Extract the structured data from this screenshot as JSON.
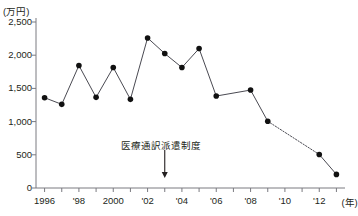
{
  "chart_data": {
    "type": "line",
    "title": "",
    "subtitle": "",
    "ylabel": "(万円)",
    "xlabel": "(年)",
    "ylim": [
      0,
      2500
    ],
    "ytick_values": [
      0,
      500,
      1000,
      1500,
      2000,
      2500
    ],
    "ytick_labels": [
      "0",
      "500",
      "1,000",
      "1,500",
      "2,000",
      "2,500"
    ],
    "xlim": [
      1995.5,
      2013.5
    ],
    "xtick_values": [
      1996,
      1997,
      1998,
      1999,
      2000,
      2001,
      2002,
      2003,
      2004,
      2005,
      2006,
      2007,
      2008,
      2009,
      2010,
      2011,
      2012,
      2013
    ],
    "xtick_labels": [
      "1996",
      "",
      "'98",
      "",
      "2000",
      "",
      "'02",
      "",
      "'04",
      "",
      "'06",
      "",
      "'08",
      "",
      "'10",
      "",
      "'12",
      ""
    ],
    "grid": false,
    "legend": "none",
    "x": [
      1996,
      1997,
      1998,
      1999,
      2000,
      2001,
      2002,
      2003,
      2004,
      2005,
      2006,
      2008,
      2009,
      2012,
      2013
    ],
    "values": [
      1360,
      1260,
      1845,
      1365,
      1815,
      1335,
      2260,
      2025,
      1815,
      2100,
      1385,
      1475,
      1005,
      505,
      205
    ],
    "dotted_segments": [
      [
        1996,
        1385,
        2008,
        1475
      ],
      [
        2009,
        1005,
        2012,
        505
      ]
    ],
    "annotations": [
      {
        "text": "医療通訳派遣制度",
        "x": 2003,
        "y": 150,
        "arrow": true
      }
    ]
  },
  "axis": {
    "unit_y": "(万円)",
    "unit_x": "(年)"
  },
  "annotation": {
    "label": "医療通訳派遣制度"
  }
}
